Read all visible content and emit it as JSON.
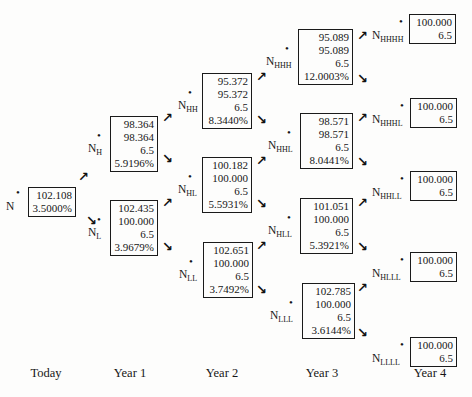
{
  "diagram_title": "binomial-interest-rate-tree",
  "columns": [
    "Today",
    "Year 1",
    "Year 2",
    "Year 3",
    "Year 4"
  ],
  "icons": {
    "bullet": "•",
    "up_arrow": "↗",
    "down_arrow": "↘"
  },
  "nodes": {
    "N": {
      "base": "N",
      "sub": "",
      "lines": [
        "102.108",
        "3.5000%"
      ]
    },
    "NH": {
      "base": "N",
      "sub": "H",
      "lines": [
        "98.364",
        "98.364",
        "6.5",
        "5.9196%"
      ]
    },
    "NL": {
      "base": "N",
      "sub": "L",
      "lines": [
        "102.435",
        "100.000",
        "6.5",
        "3.9679%"
      ]
    },
    "NHH": {
      "base": "N",
      "sub": "HH",
      "lines": [
        "95.372",
        "95.372",
        "6.5",
        "8.3440%"
      ]
    },
    "NHL": {
      "base": "N",
      "sub": "HL",
      "lines": [
        "100.182",
        "100.000",
        "6.5",
        "5.5931%"
      ]
    },
    "NLL": {
      "base": "N",
      "sub": "LL",
      "lines": [
        "102.651",
        "100.000",
        "6.5",
        "3.7492%"
      ]
    },
    "NHHH": {
      "base": "N",
      "sub": "HHH",
      "lines": [
        "95.089",
        "95.089",
        "6.5",
        "12.0003%"
      ]
    },
    "NHHL": {
      "base": "N",
      "sub": "HHL",
      "lines": [
        "98.571",
        "98.571",
        "6.5",
        "8.0441%"
      ]
    },
    "NHLL": {
      "base": "N",
      "sub": "HLL",
      "lines": [
        "101.051",
        "100.000",
        "6.5",
        "5.3921%"
      ]
    },
    "NLLL": {
      "base": "N",
      "sub": "LLL",
      "lines": [
        "102.785",
        "100.000",
        "6.5",
        "3.6144%"
      ]
    },
    "NHHHH": {
      "base": "N",
      "sub": "HHHH",
      "lines": [
        "100.000",
        "6.5"
      ]
    },
    "NHHHL": {
      "base": "N",
      "sub": "HHHL",
      "lines": [
        "100.000",
        "6.5"
      ]
    },
    "NHHLL": {
      "base": "N",
      "sub": "HHLL",
      "lines": [
        "100.000",
        "6.5"
      ]
    },
    "NHLLL": {
      "base": "N",
      "sub": "HLLL",
      "lines": [
        "100.000",
        "6.5"
      ]
    },
    "NLLLL": {
      "base": "N",
      "sub": "LLLL",
      "lines": [
        "100.000",
        "6.5"
      ]
    }
  }
}
